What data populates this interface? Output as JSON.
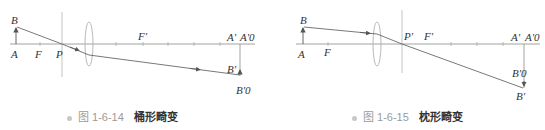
{
  "figures": [
    {
      "id": "fig-1-6-14",
      "caption_number": "图 1-6-14",
      "caption_title": "桶形畸变",
      "labels": {
        "B": "B",
        "A": "A",
        "F": "F",
        "P": "P",
        "F_prime": "F'",
        "A_prime": "A'",
        "A0_prime": "A'0",
        "B_prime": "B'",
        "B0_prime": "B'0"
      }
    },
    {
      "id": "fig-1-6-15",
      "caption_number": "图 1-6-15",
      "caption_title": "枕形畸变",
      "labels": {
        "B": "B",
        "A": "A",
        "F": "F",
        "P_prime": "P'",
        "F_prime": "F'",
        "A_prime": "A'",
        "A0_prime": "A'0",
        "B0_prime": "B'0",
        "B_prime": "B'"
      }
    }
  ],
  "colors": {
    "line": "#8a8a8a",
    "ray": "#555555",
    "lens": "#b0b0b0",
    "label": "#333333",
    "caption_number": "#9a9a9a",
    "caption_title": "#333333"
  }
}
